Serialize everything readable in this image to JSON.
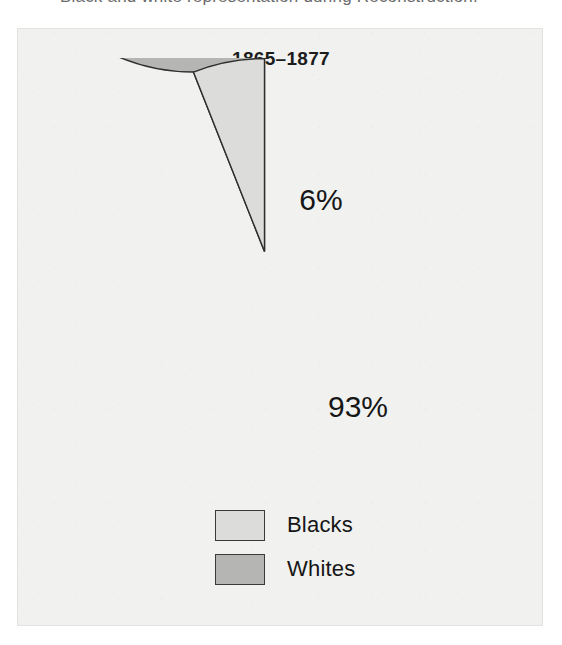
{
  "caption": {
    "text": "Black and white representation during Reconstruction."
  },
  "panel": {
    "title": "1865–1877"
  },
  "chart_data": {
    "type": "pie",
    "title": "1865–1877",
    "xlabel": "",
    "ylabel": "",
    "categories": [
      "Blacks",
      "Whites"
    ],
    "values": [
      6,
      93
    ],
    "unit": "%",
    "data_labels": [
      "6%",
      "93%"
    ],
    "colors": [
      "#dcdcda",
      "#b5b5b3"
    ],
    "stroke_color": "#2e2e2e",
    "legend_position": "bottom",
    "grid": false,
    "start_angle_deg": 0,
    "direction": "counterclockwise",
    "slices": [
      {
        "name": "Blacks",
        "value": 6,
        "label": "6%",
        "color": "#dcdcda",
        "label_x": 250,
        "label_y": 152
      },
      {
        "name": "Whites",
        "value": 93,
        "label": "93%",
        "color": "#b5b5b3",
        "label_x": 287,
        "label_y": 359
      }
    ]
  },
  "legend": {
    "items": [
      {
        "label": "Blacks",
        "color": "#dcdcda"
      },
      {
        "label": "Whites",
        "color": "#b5b5b3"
      }
    ]
  }
}
